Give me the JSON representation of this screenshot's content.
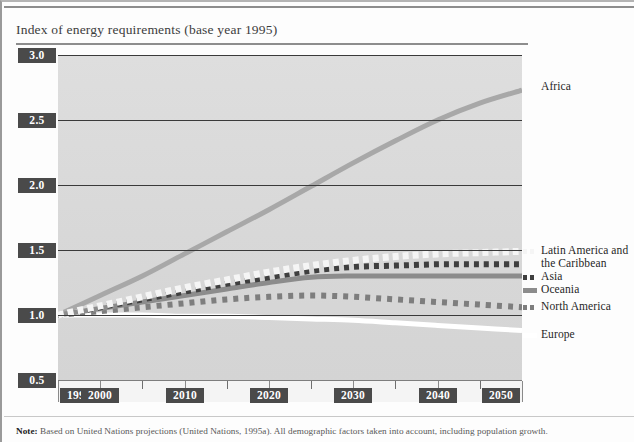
{
  "figure": {
    "title": "Index of energy requirements (base year 1995)",
    "note_label": "Note:",
    "note_text": " Based on United Nations projections (United Nations, 1995a). All demographic factors taken into account, including population growth."
  },
  "chart_data": {
    "type": "line",
    "title": "Index of energy requirements (base year 1995)",
    "xlabel": "",
    "ylabel": "",
    "xlim": [
      1995,
      2050
    ],
    "ylim": [
      0.5,
      3.0
    ],
    "yticks": [
      "0.5",
      "1.0",
      "1.5",
      "2.0",
      "2.5",
      "3.0"
    ],
    "ytick_values": [
      0.5,
      1.0,
      1.5,
      2.0,
      2.5,
      3.0
    ],
    "xticks": [
      "1995",
      "2000",
      "2010",
      "2020",
      "2030",
      "2040",
      "2050"
    ],
    "xtick_values": [
      1995,
      2000,
      2010,
      2020,
      2030,
      2040,
      2050
    ],
    "xminor_values": [
      2005,
      2015,
      2025,
      2035,
      2045
    ],
    "grid": "horizontal",
    "legend_position": "right-of-plot",
    "x": [
      1995,
      2000,
      2005,
      2010,
      2015,
      2020,
      2025,
      2030,
      2035,
      2040,
      2045,
      2050
    ],
    "series": [
      {
        "name": "Africa",
        "style": "solid",
        "color": "#a8a8a8",
        "width": 5,
        "values": [
          1.0,
          1.15,
          1.3,
          1.47,
          1.64,
          1.81,
          1.99,
          2.17,
          2.34,
          2.5,
          2.63,
          2.73
        ]
      },
      {
        "name": "Latin America and the Caribbean",
        "style": "dashed-white",
        "color": "#f5f5f5",
        "width": 7,
        "values": [
          1.0,
          1.07,
          1.14,
          1.21,
          1.27,
          1.33,
          1.38,
          1.42,
          1.45,
          1.47,
          1.48,
          1.49
        ]
      },
      {
        "name": "Asia",
        "style": "dashed-dark",
        "color": "#3f3f3f",
        "width": 6,
        "values": [
          1.0,
          1.06,
          1.12,
          1.18,
          1.24,
          1.29,
          1.34,
          1.37,
          1.38,
          1.39,
          1.39,
          1.39
        ]
      },
      {
        "name": "Oceania",
        "style": "solid",
        "color": "#8c8c8c",
        "width": 5,
        "values": [
          1.0,
          1.05,
          1.1,
          1.15,
          1.2,
          1.25,
          1.29,
          1.3,
          1.3,
          1.3,
          1.3,
          1.3
        ]
      },
      {
        "name": "North America",
        "style": "dashed-gray",
        "color": "#7e7e7e",
        "width": 6,
        "values": [
          1.0,
          1.03,
          1.06,
          1.09,
          1.12,
          1.14,
          1.15,
          1.14,
          1.12,
          1.1,
          1.08,
          1.06
        ]
      },
      {
        "name": "Europe",
        "style": "solid",
        "color": "#ffffff",
        "width": 5,
        "values": [
          1.0,
          1.0,
          1.0,
          0.99,
          0.99,
          0.98,
          0.97,
          0.96,
          0.94,
          0.92,
          0.9,
          0.88
        ]
      }
    ]
  },
  "legend": [
    {
      "name": "Africa",
      "label": "Africa"
    },
    {
      "name": "latin-america",
      "label": "Latin America and"
    },
    {
      "name": "latin-america-2",
      "label": "the Caribbean"
    },
    {
      "name": "asia",
      "label": "Asia"
    },
    {
      "name": "oceania",
      "label": "Oceania"
    },
    {
      "name": "north-america",
      "label": "North America"
    },
    {
      "name": "europe",
      "label": "Europe"
    }
  ],
  "colors": {
    "plot_background": "#dcdcdc",
    "tick_chip": "#4a4a4a",
    "gridline": "#3a3a3a",
    "africa": "#a8a8a8",
    "latin_america": "#f5f5f5",
    "asia": "#3f3f3f",
    "oceania": "#8c8c8c",
    "north_america": "#7e7e7e",
    "europe": "#ffffff"
  }
}
